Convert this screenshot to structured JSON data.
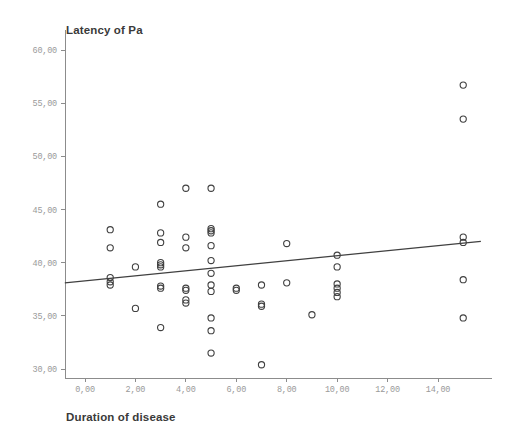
{
  "chart_data": {
    "type": "scatter",
    "title": "",
    "xlabel": "Duration of disease",
    "ylabel": "Latency of Pa",
    "xlim": [
      -0.6,
      15.6
    ],
    "ylim": [
      29.0,
      60.8
    ],
    "xticks": [
      "0,00",
      "2,00",
      "4,00",
      "6,00",
      "8,00",
      "10,00",
      "12,00",
      "14,00"
    ],
    "xtick_values": [
      0,
      2,
      4,
      6,
      8,
      10,
      12,
      14
    ],
    "yticks": [
      "30,00",
      "35,00",
      "40,00",
      "45,00",
      "50,00",
      "55,00",
      "60,00"
    ],
    "ytick_values": [
      30,
      35,
      40,
      45,
      50,
      55,
      60
    ],
    "grid": false,
    "legend": false,
    "decimal_separator": ",",
    "marker": "open-circle",
    "marker_color": "#404040",
    "points": [
      [
        1,
        43.1
      ],
      [
        1,
        41.4
      ],
      [
        1,
        38.6
      ],
      [
        1,
        38.2
      ],
      [
        1,
        37.9
      ],
      [
        2,
        39.6
      ],
      [
        2,
        35.7
      ],
      [
        3,
        45.5
      ],
      [
        3,
        42.8
      ],
      [
        3,
        41.9
      ],
      [
        3,
        40.0
      ],
      [
        3,
        39.8
      ],
      [
        3,
        39.6
      ],
      [
        3,
        37.8
      ],
      [
        3,
        37.6
      ],
      [
        3,
        33.9
      ],
      [
        4,
        47.0
      ],
      [
        4,
        42.4
      ],
      [
        4,
        41.4
      ],
      [
        4,
        37.6
      ],
      [
        4,
        37.4
      ],
      [
        4,
        36.5
      ],
      [
        4,
        36.2
      ],
      [
        5,
        47.0
      ],
      [
        5,
        43.2
      ],
      [
        5,
        43.0
      ],
      [
        5,
        42.8
      ],
      [
        5,
        41.6
      ],
      [
        5,
        40.2
      ],
      [
        5,
        39.0
      ],
      [
        5,
        37.9
      ],
      [
        5,
        37.3
      ],
      [
        5,
        34.8
      ],
      [
        5,
        33.6
      ],
      [
        5,
        31.5
      ],
      [
        6,
        37.6
      ],
      [
        6,
        37.4
      ],
      [
        7,
        37.9
      ],
      [
        7,
        36.1
      ],
      [
        7,
        35.9
      ],
      [
        7,
        30.4
      ],
      [
        8,
        41.8
      ],
      [
        8,
        38.1
      ],
      [
        9,
        35.1
      ],
      [
        10,
        40.7
      ],
      [
        10,
        39.6
      ],
      [
        10,
        38.0
      ],
      [
        10,
        37.6
      ],
      [
        10,
        37.2
      ],
      [
        10,
        36.8
      ],
      [
        15,
        56.7
      ],
      [
        15,
        53.5
      ],
      [
        15,
        42.4
      ],
      [
        15,
        41.9
      ],
      [
        15,
        38.4
      ],
      [
        15,
        34.8
      ]
    ],
    "fit_line": {
      "type": "linear-regression",
      "x_start": -0.8,
      "y_start": 38.1,
      "x_end": 15.7,
      "y_end": 42.0
    }
  },
  "accent_colors": {
    "marker": "#404040",
    "axis": "#8c8c8c",
    "tick_text": "#9a9a9a",
    "title_text": "#3a3a3a",
    "background": "#ffffff"
  }
}
